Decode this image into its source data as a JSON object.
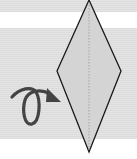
{
  "diagram": {
    "colors": {
      "paper_fill": "#d4d4d4",
      "outline": "#1a1a1a",
      "arrow": "#444444",
      "background_stripe": "#e0e0e0"
    },
    "symbols": [
      {
        "name": "turn-over-arrow",
        "meaning": "turn the model over"
      },
      {
        "name": "center-crease",
        "meaning": "existing crease line"
      }
    ]
  }
}
